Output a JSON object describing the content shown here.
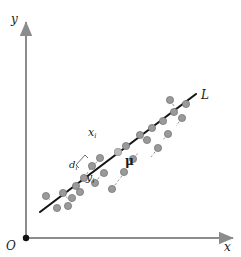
{
  "figure": {
    "type": "scatter-with-principal-axis",
    "background_color": "#ffffff",
    "axes": {
      "color": "#8c8c8c",
      "origin_label": "O",
      "x_axis_label": "x",
      "y_axis_label": "y",
      "origin_dot_color": "#111111",
      "x_axis": {
        "x1": 26,
        "y1": 238,
        "x2": 233,
        "y2": 238
      },
      "y_axis": {
        "x1": 26,
        "y1": 238,
        "x2": 26,
        "y2": 22
      }
    },
    "line": {
      "label": "L",
      "color": "#141414",
      "width": 2.1,
      "x1": 40,
      "y1": 212,
      "x2": 196,
      "y2": 94
    },
    "mean_point": {
      "label": "μ",
      "x": 118,
      "y": 152,
      "color": "#b9b9b9",
      "radius": 3.6
    },
    "sample_point": {
      "label_x": "x",
      "label_x_sub": "i",
      "label_y": "y",
      "label_y_sub": "i",
      "label_d": "d",
      "label_d_sub": "i",
      "point_x": 84,
      "point_y": 178,
      "foot_x": 92,
      "foot_y": 166
    },
    "point_color": "#9a9a9a",
    "point_stroke": "#6e6e6e",
    "point_radius": 3.6,
    "dash_color": "#9a9a9a",
    "points": [
      {
        "x": 46,
        "y": 196
      },
      {
        "x": 57,
        "y": 208
      },
      {
        "x": 63,
        "y": 193
      },
      {
        "x": 68,
        "y": 206
      },
      {
        "x": 76,
        "y": 186
      },
      {
        "x": 72,
        "y": 198
      },
      {
        "x": 84,
        "y": 178
      },
      {
        "x": 80,
        "y": 192
      },
      {
        "x": 92,
        "y": 166
      },
      {
        "x": 95,
        "y": 183
      },
      {
        "x": 104,
        "y": 173
      },
      {
        "x": 100,
        "y": 158
      },
      {
        "x": 112,
        "y": 189
      },
      {
        "x": 118,
        "y": 152
      },
      {
        "x": 126,
        "y": 146
      },
      {
        "x": 124,
        "y": 172
      },
      {
        "x": 133,
        "y": 159
      },
      {
        "x": 140,
        "y": 135
      },
      {
        "x": 147,
        "y": 140
      },
      {
        "x": 152,
        "y": 128
      },
      {
        "x": 158,
        "y": 148
      },
      {
        "x": 163,
        "y": 121
      },
      {
        "x": 168,
        "y": 134
      },
      {
        "x": 174,
        "y": 112
      },
      {
        "x": 170,
        "y": 100
      },
      {
        "x": 182,
        "y": 118
      },
      {
        "x": 186,
        "y": 104
      }
    ],
    "projections": [
      {
        "x1": 46,
        "y1": 196,
        "x2": 50,
        "y2": 200
      },
      {
        "x1": 63,
        "y1": 193,
        "x2": 69,
        "y2": 200
      },
      {
        "x1": 68,
        "y1": 206,
        "x2": 74,
        "y2": 198
      },
      {
        "x1": 76,
        "y1": 186,
        "x2": 80,
        "y2": 191
      },
      {
        "x1": 84,
        "y1": 178,
        "x2": 92,
        "y2": 166
      },
      {
        "x1": 95,
        "y1": 183,
        "x2": 103,
        "y2": 172
      },
      {
        "x1": 100,
        "y1": 158,
        "x2": 95,
        "y2": 164
      },
      {
        "x1": 112,
        "y1": 189,
        "x2": 124,
        "y2": 173
      },
      {
        "x1": 124,
        "y1": 172,
        "x2": 131,
        "y2": 162
      },
      {
        "x1": 133,
        "y1": 159,
        "x2": 139,
        "y2": 152
      },
      {
        "x1": 140,
        "y1": 135,
        "x2": 145,
        "y2": 142
      },
      {
        "x1": 158,
        "y1": 148,
        "x2": 151,
        "y2": 157
      },
      {
        "x1": 168,
        "y1": 134,
        "x2": 162,
        "y2": 141
      },
      {
        "x1": 170,
        "y1": 100,
        "x2": 176,
        "y2": 109
      },
      {
        "x1": 182,
        "y1": 118,
        "x2": 176,
        "y2": 126
      }
    ]
  }
}
